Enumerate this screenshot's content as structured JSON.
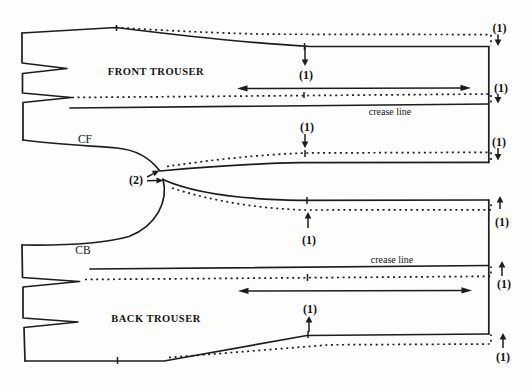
{
  "figure": {
    "kind": "trouser-pattern-alteration-diagram",
    "background_color": "#fdfdfb",
    "ink_color": "#1d1d1d",
    "dashed_lines_meaning": "shifted pattern outline",
    "pieces": {
      "front": {
        "title": "FRONT TROUSER",
        "edge_label": "CF",
        "crease_label": "crease line",
        "dart_notches": 2,
        "shift_direction": "down"
      },
      "back": {
        "title": "BACK TROUSER",
        "edge_label": "CB",
        "crease_label": "crease line",
        "dart_notches": 2,
        "shift_direction": "up"
      }
    },
    "marks": [
      {
        "label": "(1)",
        "direction": "down",
        "at": "front side seam, mid"
      },
      {
        "label": "(1)",
        "direction": "down",
        "at": "front hem, top corner"
      },
      {
        "label": "(1)",
        "direction": "down",
        "at": "front hem, crease"
      },
      {
        "label": "(1)",
        "direction": "down",
        "at": "front crease, mid"
      },
      {
        "label": "(1)",
        "direction": "down",
        "at": "front hem, inseam"
      },
      {
        "label": "(2)",
        "direction": "right",
        "at": "crotch points"
      },
      {
        "label": "(1)",
        "direction": "up",
        "at": "back inseam, mid"
      },
      {
        "label": "(1)",
        "direction": "up",
        "at": "back hem, inseam"
      },
      {
        "label": "(1)",
        "direction": "up",
        "at": "back hem, crease"
      },
      {
        "label": "(1)",
        "direction": "up",
        "at": "back hem edge, mid"
      },
      {
        "label": "(1)",
        "direction": "up",
        "at": "back hem, bottom corner"
      }
    ]
  }
}
